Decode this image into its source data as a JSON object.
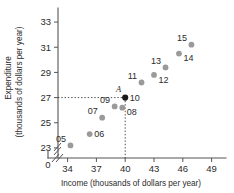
{
  "chart_data": {
    "type": "scatter",
    "title": "",
    "xlabel": "Income (thousands of dollars per year)",
    "ylabel_line1": "Expenditure",
    "ylabel_line2": "(thousands of dollars per year)",
    "xlim": [
      33.0,
      50.5
    ],
    "ylim": [
      22.2,
      33.8
    ],
    "x_origin_label": "0",
    "xticks": [
      34,
      37,
      40,
      43,
      46,
      49
    ],
    "xtick_labels": [
      "34",
      "37",
      "40",
      "43",
      "46",
      "49"
    ],
    "yticks": [
      23,
      25,
      27,
      29,
      31,
      33
    ],
    "ytick_labels": [
      "23",
      "25",
      "27",
      "29",
      "31",
      "33"
    ],
    "axis_break_x": true,
    "axis_break_y": true,
    "grid": false,
    "legend": "none",
    "points": [
      {
        "label": "05",
        "x": 34.3,
        "y": 23.2,
        "label_pos": "left",
        "highlight": false
      },
      {
        "label": "06",
        "x": 36.3,
        "y": 24.1,
        "label_pos": "right",
        "highlight": false
      },
      {
        "label": "07",
        "x": 37.6,
        "y": 25.4,
        "label_pos": "left",
        "highlight": false
      },
      {
        "label": "09",
        "x": 38.9,
        "y": 26.3,
        "label_pos": "left",
        "highlight": false
      },
      {
        "label": "08",
        "x": 39.7,
        "y": 26.2,
        "label_pos": "rightbelow",
        "highlight": false
      },
      {
        "label": "10",
        "x": 40.0,
        "y": 27.0,
        "label_pos": "right",
        "highlight": true
      },
      {
        "label": "11",
        "x": 41.7,
        "y": 28.2,
        "label_pos": "left",
        "highlight": false
      },
      {
        "label": "12",
        "x": 43.0,
        "y": 28.8,
        "label_pos": "rightbelow",
        "highlight": false
      },
      {
        "label": "13",
        "x": 44.2,
        "y": 29.4,
        "label_pos": "left",
        "highlight": false
      },
      {
        "label": "14",
        "x": 45.6,
        "y": 30.5,
        "label_pos": "rightbelow",
        "highlight": false
      },
      {
        "label": "15",
        "x": 46.9,
        "y": 31.2,
        "label_pos": "left",
        "highlight": false
      }
    ],
    "annotations": [
      {
        "name": "point-a-label",
        "text": "A",
        "x": 39.3,
        "y": 27.45,
        "italic": true
      }
    ],
    "reference_lines": [
      {
        "name": "horizontal-reference-line",
        "orientation": "horizontal",
        "value": 27.0,
        "from": 33.0,
        "to": 40.0
      },
      {
        "name": "vertical-reference-line",
        "orientation": "vertical",
        "value": 40.0,
        "from": 22.2,
        "to": 27.0
      }
    ],
    "colors": {
      "point": "#9a9a9a",
      "point_highlight": "#1a1a1a",
      "axis": "#555555",
      "text": "#2b2b2b",
      "reference_line": "#3a3a3a",
      "background": "#ffffff"
    }
  }
}
